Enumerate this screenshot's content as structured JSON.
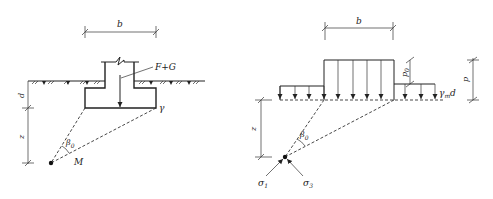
{
  "left_diagram": {
    "width_label": "b",
    "load_label": "F+G",
    "unit_weight_label": "γ",
    "depth_label": "d",
    "z_label": "z",
    "angle_label": "β",
    "angle_subscript": "0",
    "point_label": "M"
  },
  "right_diagram": {
    "width_label": "b",
    "p0_label": "p",
    "p0_subscript": "0",
    "p_label": "p",
    "overburden_label_gamma": "γ",
    "overburden_subscript": "m",
    "overburden_d": "d",
    "z_label": "z",
    "angle_label": "β",
    "angle_subscript": "0",
    "sigma1_label": "σ",
    "sigma1_subscript": "1",
    "sigma3_label": "σ",
    "sigma3_subscript": "3"
  },
  "colors": {
    "line": "#222222",
    "background": "#ffffff"
  }
}
